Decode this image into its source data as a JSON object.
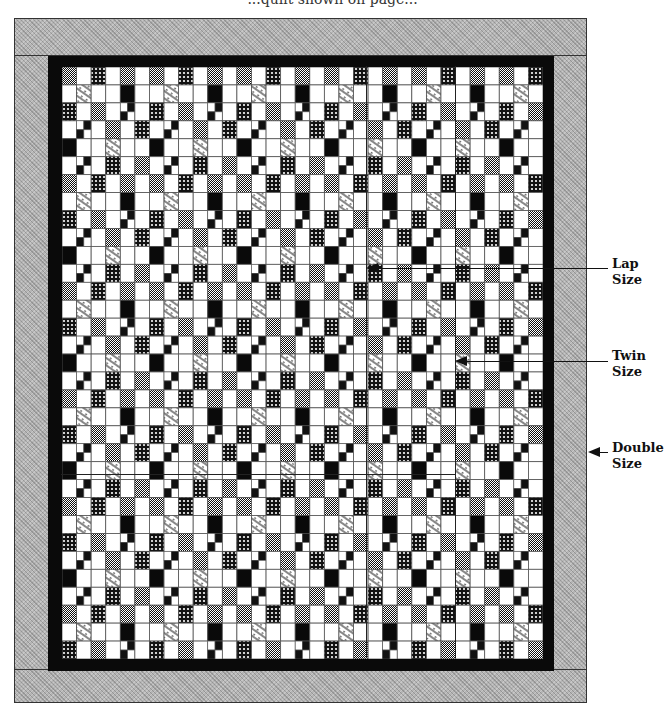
{
  "page": {
    "cut_text": "...quilt shown on page...",
    "background": "#ffffff"
  },
  "quilt": {
    "columns": 33,
    "rows": 33,
    "cell_px": 14.55,
    "colors": {
      "border_gray": "#b5b5b5",
      "inner_border": "#0a0a0a",
      "white": "#ffffff",
      "black": "#0a0a0a",
      "grid_line": "#555555"
    },
    "motif": [
      "DWCWSWDWCWSW",
      "WLWWBWWLWWBW",
      "CWSWFWCWSWFW",
      "WFWSWCWFWSWC",
      "BWWLWWBWWLWW",
      "WFWCWSWFWCWS"
    ]
  },
  "size_lines": {
    "lap": {
      "x": 366
    },
    "twin": {
      "x": 455
    },
    "horizontal": {
      "y": 474
    }
  },
  "annotations": [
    {
      "id": "lap",
      "line1": "Lap",
      "line2": "Size"
    },
    {
      "id": "twin",
      "line1": "Twin",
      "line2": "Size"
    },
    {
      "id": "double",
      "line1": "Double",
      "line2": "Size"
    }
  ]
}
